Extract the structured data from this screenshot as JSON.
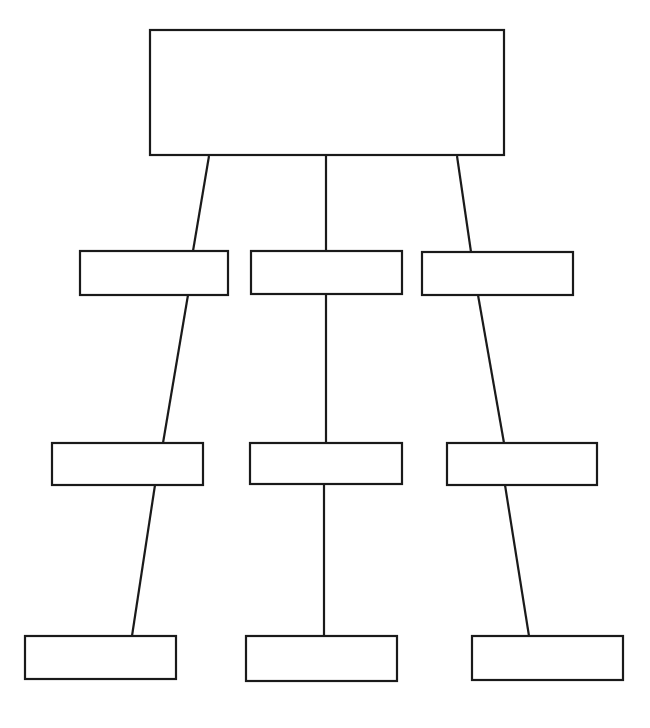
{
  "document": {
    "title": "Blank Hierarchy Flowchart Template",
    "background_color": "#ffffff",
    "stroke_color": "#1a1a1a",
    "fill_color": "#ffffff",
    "stroke_width": 2.2,
    "canvas_width": 650,
    "canvas_height": 728
  },
  "diagram": {
    "type": "flowchart",
    "orientation": "top-down",
    "row_count": 4,
    "node_count": 10,
    "connector_count": 9,
    "all_labels_empty": true
  },
  "nodes": [
    {
      "id": "node-root",
      "label": "",
      "row": 1,
      "column": 1,
      "x": 150,
      "y": 30,
      "width": 354,
      "height": 125
    },
    {
      "id": "node-r2-c1",
      "label": "",
      "row": 2,
      "column": 1,
      "x": 80,
      "y": 251,
      "width": 148,
      "height": 44
    },
    {
      "id": "node-r2-c2",
      "label": "",
      "row": 2,
      "column": 2,
      "x": 251,
      "y": 251,
      "width": 151,
      "height": 43
    },
    {
      "id": "node-r2-c3",
      "label": "",
      "row": 2,
      "column": 3,
      "x": 422,
      "y": 252,
      "width": 151,
      "height": 43
    },
    {
      "id": "node-r3-c1",
      "label": "",
      "row": 3,
      "column": 1,
      "x": 52,
      "y": 443,
      "width": 151,
      "height": 42
    },
    {
      "id": "node-r3-c2",
      "label": "",
      "row": 3,
      "column": 2,
      "x": 250,
      "y": 443,
      "width": 152,
      "height": 41
    },
    {
      "id": "node-r3-c3",
      "label": "",
      "row": 3,
      "column": 3,
      "x": 447,
      "y": 443,
      "width": 150,
      "height": 42
    },
    {
      "id": "node-r4-c1",
      "label": "",
      "row": 4,
      "column": 1,
      "x": 25,
      "y": 636,
      "width": 151,
      "height": 43
    },
    {
      "id": "node-r4-c2",
      "label": "",
      "row": 4,
      "column": 2,
      "x": 246,
      "y": 636,
      "width": 151,
      "height": 45
    },
    {
      "id": "node-r4-c3",
      "label": "",
      "row": 4,
      "column": 3,
      "x": 472,
      "y": 636,
      "width": 151,
      "height": 44
    }
  ],
  "connectors": [
    {
      "id": "connector-root-to-r2c1",
      "from": "node-root",
      "to": "node-r2-c1",
      "x1": 209,
      "y1": 156,
      "x2": 193,
      "y2": 251
    },
    {
      "id": "connector-root-to-r2c2",
      "from": "node-root",
      "to": "node-r2-c2",
      "x1": 326,
      "y1": 156,
      "x2": 326,
      "y2": 251
    },
    {
      "id": "connector-root-to-r2c3",
      "from": "node-root",
      "to": "node-r2-c3",
      "x1": 457,
      "y1": 156,
      "x2": 471,
      "y2": 252
    },
    {
      "id": "connector-r2c1-to-r3c1",
      "from": "node-r2-c1",
      "to": "node-r3-c1",
      "x1": 188,
      "y1": 295,
      "x2": 163,
      "y2": 443
    },
    {
      "id": "connector-r2c2-to-r3c2",
      "from": "node-r2-c2",
      "to": "node-r3-c2",
      "x1": 326,
      "y1": 294,
      "x2": 326,
      "y2": 443
    },
    {
      "id": "connector-r2c3-to-r3c3",
      "from": "node-r2-c3",
      "to": "node-r3-c3",
      "x1": 478,
      "y1": 295,
      "x2": 504,
      "y2": 443
    },
    {
      "id": "connector-r3c1-to-r4c1",
      "from": "node-r3-c1",
      "to": "node-r4-c1",
      "x1": 155,
      "y1": 485,
      "x2": 132,
      "y2": 636
    },
    {
      "id": "connector-r3c2-to-r4c2",
      "from": "node-r3-c2",
      "to": "node-r4-c2",
      "x1": 324,
      "y1": 484,
      "x2": 324,
      "y2": 636
    },
    {
      "id": "connector-r3c3-to-r4c3",
      "from": "node-r3-c3",
      "to": "node-r4-c3",
      "x1": 505,
      "y1": 485,
      "x2": 529,
      "y2": 636
    }
  ]
}
